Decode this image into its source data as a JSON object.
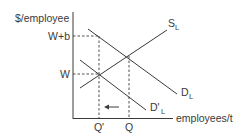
{
  "diagram": {
    "type": "labor market supply-demand diagram",
    "y_axis_label": "$/employee",
    "x_axis_label": "employees/t",
    "y_ticks": [
      {
        "label": "W+b",
        "y": 36
      },
      {
        "label": "W",
        "y": 74
      }
    ],
    "x_ticks": [
      {
        "label": "Q'",
        "x": 99
      },
      {
        "label": "Q",
        "x": 129
      }
    ],
    "curves": [
      {
        "name": "S",
        "subscript": "L",
        "label": "S_L"
      },
      {
        "name": "D",
        "subscript": "L",
        "label": "D_L"
      },
      {
        "name": "D'",
        "subscript": "L",
        "label": "D'_L"
      }
    ],
    "arrow": {
      "direction": "left",
      "meaning": "employment shifts from Q to Q'"
    },
    "colors": {
      "line": "#3a3a3a",
      "background": "#ffffff"
    }
  }
}
